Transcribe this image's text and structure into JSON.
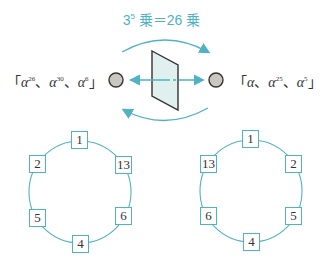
{
  "title": {
    "base": "3",
    "exp": "5",
    "text": "乗＝26 乗"
  },
  "left_set": {
    "open": "「",
    "close": "」",
    "items": [
      {
        "sym": "α",
        "exp": "26"
      },
      {
        "sym": "α",
        "exp": "30"
      },
      {
        "sym": "α",
        "exp": "6"
      }
    ],
    "sep": "、"
  },
  "right_set": {
    "open": "「",
    "close": "」",
    "items": [
      {
        "sym": "α",
        "exp": ""
      },
      {
        "sym": "α",
        "exp": "25"
      },
      {
        "sym": "α",
        "exp": "5"
      }
    ],
    "sep": "、"
  },
  "colors": {
    "accent": "#4fb3c4",
    "dot": "#c8c8c0",
    "mirror": "#dff0ee"
  },
  "left_ring": {
    "nodes": [
      "1",
      "13",
      "6",
      "4",
      "5",
      "2"
    ]
  },
  "right_ring": {
    "nodes": [
      "1",
      "2",
      "5",
      "4",
      "6",
      "13"
    ]
  }
}
